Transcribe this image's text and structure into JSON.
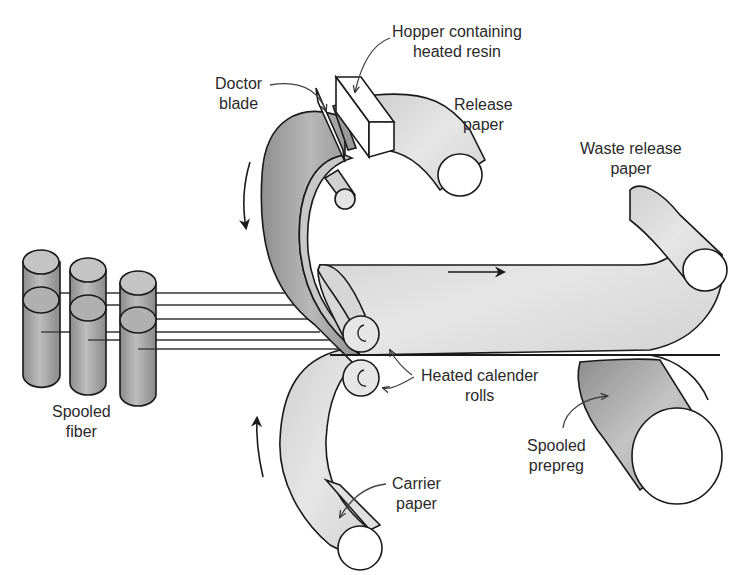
{
  "diagram": {
    "type": "prepreg production process schematic",
    "colors": {
      "background": "#ffffff",
      "outline": "#1a1a1a",
      "paper_fill": "#d9d9d9",
      "dark_fill": "#9a9a9a",
      "spool_end": "#ffffff",
      "text": "#2a2a2a"
    },
    "labels": {
      "hopper": {
        "line1": "Hopper containing",
        "line2": "heated resin"
      },
      "doctor_blade": {
        "line1": "Doctor",
        "line2": "blade"
      },
      "release_paper": {
        "line1": "Release",
        "line2": "paper"
      },
      "waste_release_paper": {
        "line1": "Waste release",
        "line2": "paper"
      },
      "spooled_fiber": {
        "line1": "Spooled",
        "line2": "fiber"
      },
      "heated_calender_rolls": {
        "line1": "Heated calender",
        "line2": "rolls"
      },
      "spooled_prepreg": {
        "line1": "Spooled",
        "line2": "prepreg"
      },
      "carrier_paper": {
        "line1": "Carrier",
        "line2": "paper"
      }
    },
    "flow_arrows": [
      "downward (release paper)",
      "rightward (prepreg)",
      "upward (carrier paper)"
    ],
    "fiber_spool_count": 3,
    "fiber_strand_count": 6
  }
}
